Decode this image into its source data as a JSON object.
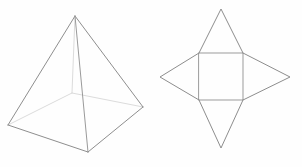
{
  "figure": {
    "background_color": "#fefefe",
    "stroke_color_visible": "#8e8e8e",
    "stroke_color_hidden": "#dcdcdc",
    "width": 302,
    "height": 167
  },
  "chart_data": {
    "type": "diagram",
    "xlabel": "",
    "ylabel": "",
    "shapes": [
      {
        "name": "square-pyramid-3d",
        "kind": "wireframe-solid",
        "description": "Square pyramid drawn in oblique perspective with apex at top and a square base",
        "vertices": {
          "apex": [
            75,
            16
          ],
          "base_front": [
            88,
            152
          ],
          "base_left": [
            8,
            125
          ],
          "base_right": [
            143,
            107
          ],
          "base_back": [
            72,
            93
          ]
        },
        "visible_edges": [
          [
            "apex",
            "base_left"
          ],
          [
            "apex",
            "base_front"
          ],
          [
            "apex",
            "base_right"
          ],
          [
            "base_left",
            "base_front"
          ],
          [
            "base_front",
            "base_right"
          ]
        ],
        "hidden_edges": [
          [
            "apex",
            "base_back"
          ],
          [
            "base_left",
            "base_back"
          ],
          [
            "base_back",
            "base_right"
          ]
        ]
      },
      {
        "name": "square-pyramid-net",
        "kind": "net",
        "description": "Unfolded net: a central square with one isosceles triangle attached to each of its four sides",
        "square": {
          "top_left": [
            199,
            53
          ],
          "top_right": [
            243,
            53
          ],
          "bottom_right": [
            243,
            100
          ],
          "bottom_left": [
            199,
            100
          ]
        },
        "triangles": [
          {
            "name": "triangle-top",
            "apex": [
              221,
              9
            ],
            "base": [
              [
                199,
                53
              ],
              [
                243,
                53
              ]
            ]
          },
          {
            "name": "triangle-right",
            "apex": [
              290,
              77
            ],
            "base": [
              [
                243,
                53
              ],
              [
                243,
                100
              ]
            ]
          },
          {
            "name": "triangle-bottom",
            "apex": [
              221,
              148
            ],
            "base": [
              [
                243,
                100
              ],
              [
                199,
                100
              ]
            ]
          },
          {
            "name": "triangle-left",
            "apex": [
              160,
              77
            ],
            "base": [
              [
                199,
                100
              ],
              [
                199,
                53
              ]
            ]
          }
        ]
      }
    ],
    "legend": [],
    "annotations": []
  }
}
